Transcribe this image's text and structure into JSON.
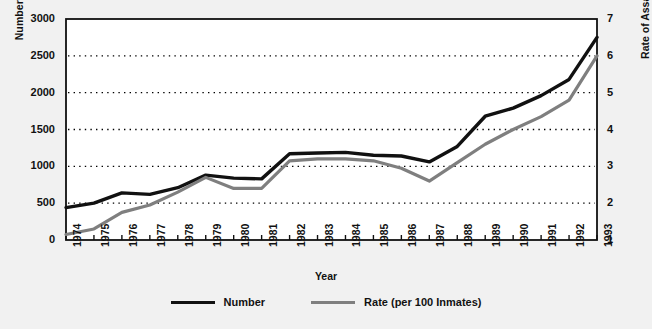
{
  "chart_data": {
    "type": "line",
    "title": "",
    "xlabel": "Year",
    "ylabel": "Number of Assaults",
    "y2label": "Rate of Assaults",
    "grid": true,
    "legend_position": "bottom",
    "categories": [
      "1974",
      "1975",
      "1976",
      "1977",
      "1978",
      "1979",
      "1980",
      "1981",
      "1982",
      "1983",
      "1984",
      "1985",
      "1986",
      "1987",
      "1988",
      "1989",
      "1990",
      "1991",
      "1992",
      "1993"
    ],
    "yticks": [
      "0",
      "500",
      "1000",
      "1500",
      "2000",
      "2500",
      "3000"
    ],
    "ylim": [
      0,
      3000
    ],
    "y2ticks": [
      "1",
      "2",
      "3",
      "4",
      "5",
      "6",
      "7"
    ],
    "y2lim": [
      1,
      7
    ],
    "series": [
      {
        "name": "Number",
        "color": "#111111",
        "axis": "left",
        "values": [
          440,
          500,
          640,
          620,
          710,
          880,
          840,
          830,
          1170,
          1180,
          1190,
          1150,
          1140,
          1060,
          1270,
          1680,
          1790,
          1960,
          2180,
          2750
        ]
      },
      {
        "name": "Rate (per 100 Inmates)",
        "color": "#7f7f7f",
        "axis": "right",
        "values": [
          1.15,
          1.3,
          1.75,
          1.95,
          2.3,
          2.7,
          2.4,
          2.4,
          3.15,
          3.2,
          3.2,
          3.15,
          2.95,
          2.6,
          3.1,
          3.6,
          4.0,
          4.35,
          4.8,
          6.0
        ]
      }
    ],
    "legend": [
      {
        "label": "Number",
        "color": "#111111"
      },
      {
        "label": "Rate (per 100 Inmates)",
        "color": "#7f7f7f"
      }
    ]
  }
}
